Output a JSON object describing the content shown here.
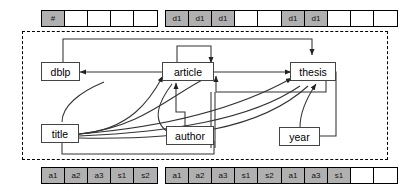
{
  "diagram": {
    "colors": {
      "filled_cell": "#b0b0b0",
      "empty_cell": "#ffffff",
      "border": "#000000",
      "node_border": "#444444",
      "edge": "#333333"
    }
  },
  "top_strips": [
    {
      "name": "strip-top-left",
      "cells": [
        {
          "label": "#",
          "filled": true
        },
        {
          "label": "",
          "filled": false
        },
        {
          "label": "",
          "filled": false
        },
        {
          "label": "",
          "filled": false
        },
        {
          "label": "",
          "filled": false
        }
      ]
    },
    {
      "name": "strip-top-middle",
      "cells": [
        {
          "label": "d1",
          "filled": true
        },
        {
          "label": "d1",
          "filled": true
        },
        {
          "label": "d1",
          "filled": true
        },
        {
          "label": "",
          "filled": false
        },
        {
          "label": "",
          "filled": false
        }
      ]
    },
    {
      "name": "strip-top-right",
      "cells": [
        {
          "label": "d1",
          "filled": true
        },
        {
          "label": "d1",
          "filled": true
        },
        {
          "label": "",
          "filled": false
        },
        {
          "label": "",
          "filled": false
        },
        {
          "label": "",
          "filled": false
        }
      ]
    }
  ],
  "bottom_strips": [
    {
      "name": "strip-bottom-left",
      "cells": [
        {
          "label": "a1",
          "filled": true
        },
        {
          "label": "a2",
          "filled": true
        },
        {
          "label": "a3",
          "filled": true
        },
        {
          "label": "s1",
          "filled": true
        },
        {
          "label": "s2",
          "filled": true
        }
      ]
    },
    {
      "name": "strip-bottom-middle",
      "cells": [
        {
          "label": "a1",
          "filled": true
        },
        {
          "label": "a2",
          "filled": true
        },
        {
          "label": "a3",
          "filled": true
        },
        {
          "label": "s1",
          "filled": true
        },
        {
          "label": "s2",
          "filled": true
        }
      ]
    },
    {
      "name": "strip-bottom-right",
      "cells": [
        {
          "label": "a1",
          "filled": true
        },
        {
          "label": "a3",
          "filled": true
        },
        {
          "label": "s1",
          "filled": true
        },
        {
          "label": "",
          "filled": false
        },
        {
          "label": "",
          "filled": false
        }
      ]
    }
  ],
  "nodes": [
    {
      "id": "dblp",
      "label": "dblp"
    },
    {
      "id": "article",
      "label": "article"
    },
    {
      "id": "thesis",
      "label": "thesis"
    },
    {
      "id": "title",
      "label": "title"
    },
    {
      "id": "author",
      "label": "author"
    },
    {
      "id": "year",
      "label": "year"
    }
  ]
}
